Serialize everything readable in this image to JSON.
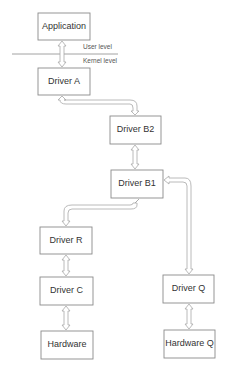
{
  "diagram": {
    "nodes": {
      "application": "Application",
      "driver_a": "Driver A",
      "driver_b2": "Driver B2",
      "driver_b1": "Driver B1",
      "driver_r": "Driver R",
      "driver_c": "Driver C",
      "hardware": "Hardware",
      "driver_q": "Driver Q",
      "hardware_q": "Hardware Q"
    },
    "levels": {
      "user": "User level",
      "kernel": "Kernel level"
    },
    "edges": [
      {
        "from": "application",
        "to": "driver_a",
        "type": "bidirectional"
      },
      {
        "from": "driver_a",
        "to": "driver_b2",
        "type": "bidirectional"
      },
      {
        "from": "driver_b2",
        "to": "driver_b1",
        "type": "bidirectional"
      },
      {
        "from": "driver_b1",
        "to": "driver_r",
        "type": "bidirectional"
      },
      {
        "from": "driver_r",
        "to": "driver_c",
        "type": "bidirectional"
      },
      {
        "from": "driver_c",
        "to": "hardware",
        "type": "bidirectional"
      },
      {
        "from": "driver_q",
        "to": "driver_b1",
        "type": "bidirectional"
      },
      {
        "from": "driver_q",
        "to": "hardware_q",
        "type": "bidirectional"
      }
    ]
  }
}
